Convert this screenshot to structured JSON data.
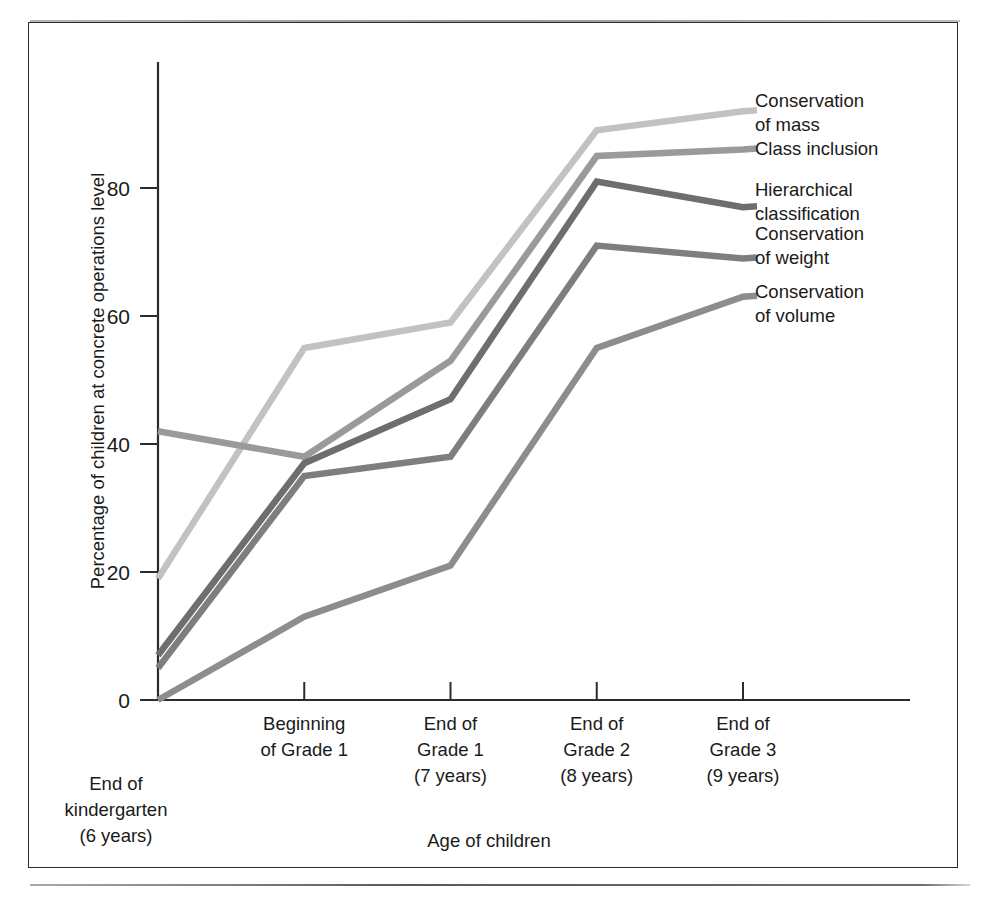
{
  "figure": {
    "top_clipped_text": "",
    "frame_color": "#2b2b2b",
    "background": "#ffffff"
  },
  "axes": {
    "y_title": "Percentage of children at concrete operations level",
    "x_title": "Age of children",
    "y_ticks": [
      "0",
      "20",
      "40",
      "60",
      "80"
    ],
    "y_min": 0,
    "y_max": 95
  },
  "x_categories": [
    {
      "line1": "End of",
      "line2": "kindergarten",
      "line3": "(6 years)",
      "position": "below"
    },
    {
      "line1": "Beginning",
      "line2": "of Grade 1",
      "line3": "",
      "position": "above"
    },
    {
      "line1": "End of",
      "line2": "Grade 1",
      "line3": "(7 years)",
      "position": "above"
    },
    {
      "line1": "End of",
      "line2": "Grade 2",
      "line3": "(8 years)",
      "position": "above"
    },
    {
      "line1": "End of",
      "line2": "Grade 3",
      "line3": "(9 years)",
      "position": "above"
    }
  ],
  "legend": [
    {
      "line1": "Conservation",
      "line2": "of mass",
      "color": "#c2c2c2"
    },
    {
      "line1": "Class inclusion",
      "line2": "",
      "color": "#9a9a9a"
    },
    {
      "line1": "Hierarchical",
      "line2": "classification",
      "color": "#6e6e6e"
    },
    {
      "line1": "Conservation",
      "line2": "of weight",
      "color": "#7e7e7e"
    },
    {
      "line1": "Conservation",
      "line2": "of volume",
      "color": "#8d8d8d"
    }
  ],
  "chart_data": {
    "type": "line",
    "title": "",
    "xlabel": "Age of children",
    "ylabel": "Percentage of children at concrete operations level",
    "ylim": [
      0,
      95
    ],
    "yticks": [
      0,
      20,
      40,
      60,
      80
    ],
    "grid": false,
    "legend_position": "right-inline",
    "categories": [
      "End of kindergarten (6 years)",
      "Beginning of Grade 1",
      "End of Grade 1 (7 years)",
      "End of Grade 2 (8 years)",
      "End of Grade 3 (9 years)"
    ],
    "series": [
      {
        "name": "Conservation of mass",
        "color": "#c2c2c2",
        "values": [
          19,
          55,
          59,
          89,
          92
        ]
      },
      {
        "name": "Class inclusion",
        "color": "#9a9a9a",
        "values": [
          42,
          38,
          53,
          85,
          86
        ]
      },
      {
        "name": "Hierarchical classification",
        "color": "#6e6e6e",
        "values": [
          7,
          37,
          47,
          81,
          77
        ]
      },
      {
        "name": "Conservation of weight",
        "color": "#7e7e7e",
        "values": [
          5,
          35,
          38,
          71,
          69
        ]
      },
      {
        "name": "Conservation of volume",
        "color": "#8d8d8d",
        "values": [
          0,
          13,
          21,
          55,
          63
        ]
      }
    ]
  }
}
